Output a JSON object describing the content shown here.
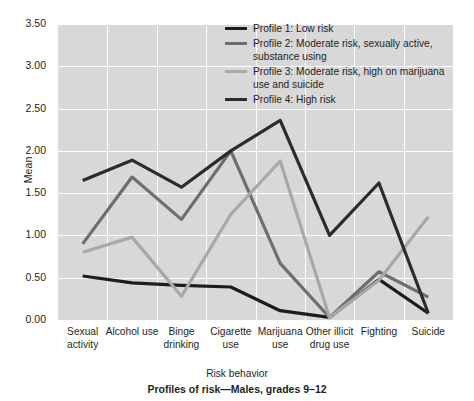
{
  "chart_data": {
    "type": "line",
    "title": "Profiles of risk—Males, grades 9–12",
    "xlabel": "Risk behavior",
    "ylabel": "Mean",
    "ylim": [
      0.0,
      3.5
    ],
    "ytick_labels": [
      "0.00",
      "0.50",
      "1.00",
      "1.50",
      "2.00",
      "2.50",
      "3.00",
      "3.50"
    ],
    "ytick_values": [
      0.0,
      0.5,
      1.0,
      1.5,
      2.0,
      2.5,
      3.0,
      3.5
    ],
    "grid": "horizontal-and-vertical",
    "legend_position": "top-right-inside",
    "categories": [
      "Sexual activity",
      "Alcohol use",
      "Binge drinking",
      "Cigarette use",
      "Marijuana use",
      "Other illicit drug use",
      "Fighting",
      "Suicide"
    ],
    "series": [
      {
        "name": "Profile 1: Low risk",
        "color": "#1c1c1c",
        "values": [
          0.52,
          0.44,
          0.41,
          0.39,
          0.11,
          0.03,
          0.48,
          0.08
        ]
      },
      {
        "name": "Profile 2: Moderate risk, sexually active, substance using",
        "color": "#6e6e6e",
        "values": [
          0.9,
          1.69,
          1.19,
          2.0,
          0.67,
          0.03,
          0.57,
          0.27
        ]
      },
      {
        "name": "Profile 3: Moderate risk, high on marijuana use and suicide",
        "color": "#a8a8a8",
        "values": [
          0.8,
          0.98,
          0.28,
          1.25,
          1.88,
          0.03,
          0.47,
          1.22
        ]
      },
      {
        "name": "Profile 4: High risk",
        "color": "#2b2b2b",
        "values": [
          1.65,
          1.89,
          1.57,
          2.0,
          2.36,
          1.0,
          1.62,
          0.08
        ]
      }
    ]
  },
  "legend": {
    "items": [
      {
        "label": "Profile 1: Low risk"
      },
      {
        "label": "Profile 2: Moderate risk, sexually active, substance using"
      },
      {
        "label": "Profile 3: Moderate risk, high on marijuana use and suicide"
      },
      {
        "label": "Profile 4: High risk"
      }
    ]
  },
  "xtick_labels": [
    "Sexual activity",
    "Alcohol use",
    "Binge drinking",
    "Cigarette use",
    "Marijuana use",
    "Other illicit drug use",
    "Fighting",
    "Suicide"
  ]
}
